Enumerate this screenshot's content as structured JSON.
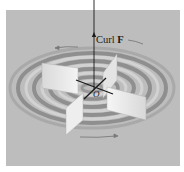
{
  "figure": {
    "background_color": "#ffffff",
    "panel_color": "#bdbdbd",
    "ring_dark_color": "#8e8e8e",
    "ring_light_color": "#d4d4d4",
    "paddle_color": "#ececec",
    "axis_color": "#1a1a1a",
    "labels": {
      "curl_prefix": "Curl ",
      "curl_vector": "F",
      "origin": "O"
    },
    "elements": {
      "rings": "concentric circular flow rings (vector field rotation)",
      "paddle_wheel": "four-vane paddle wheel",
      "rotation_arrows": 2
    }
  }
}
